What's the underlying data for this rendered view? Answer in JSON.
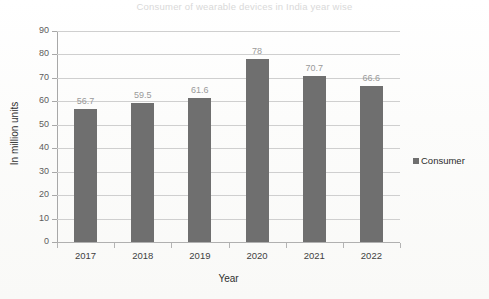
{
  "chart_data": {
    "type": "bar",
    "title": "Consumer of wearable devices in India year wise",
    "xlabel": "Year",
    "ylabel": "In million units",
    "categories": [
      "2017",
      "2018",
      "2019",
      "2020",
      "2021",
      "2022"
    ],
    "values": [
      56.7,
      59.5,
      61.6,
      78,
      70.7,
      66.6
    ],
    "value_labels": [
      "56.7",
      "59.5",
      "61.6",
      "78",
      "70.7",
      "66.6"
    ],
    "series": [
      {
        "name": "Consumer",
        "values": [
          56.7,
          59.5,
          61.6,
          78,
          70.7,
          66.6
        ],
        "color": "#6f6f6f"
      }
    ],
    "ylim": [
      0,
      90
    ],
    "ytick_step": 10,
    "yticks": [
      "90",
      "80",
      "70",
      "60",
      "50",
      "40",
      "30",
      "20",
      "10",
      "0"
    ],
    "grid": true,
    "grid_axis": "y",
    "legend": [
      "Consumer"
    ],
    "legend_position": "right",
    "bar_color": "#6f6f6f",
    "grid_color": "#cfcfcf",
    "title_color": "#d9d9d9",
    "label_color": "#9a9a9a"
  },
  "legend": {
    "entry_label": "Consumer"
  }
}
